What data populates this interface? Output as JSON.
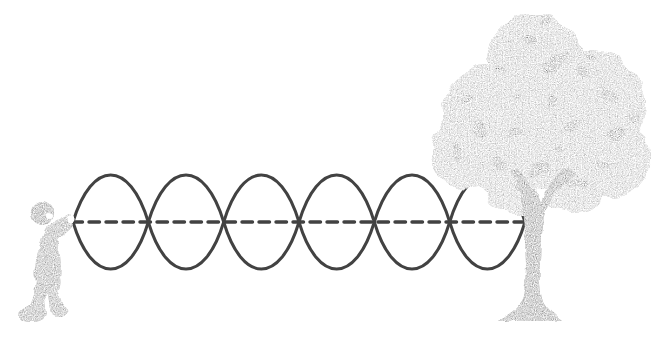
{
  "scene": {
    "description": "A child holds one end of a rope attached to a tree trunk; the rope oscillates as a standing wave with six loops about a dashed horizontal equilibrium line.",
    "background": "#ffffff"
  },
  "palette": {
    "wave_stroke": "#424242",
    "dash_stroke": "#424242",
    "foliage": "#a5a5a5",
    "foliage_spots": "#4f4f4f",
    "trunk": "#6f6f6f",
    "child_body": "#828282",
    "child_head": "#6c6c6c",
    "highlight": "#ffffff"
  },
  "wave": {
    "type": "standing-wave",
    "loops": 6,
    "x_start": 73,
    "x_end": 525,
    "center_y": 222,
    "amplitude": 47,
    "stroke_width": 3,
    "dashed_line": {
      "x_start": 72,
      "x_end": 541,
      "y": 222,
      "stroke_width": 3.4,
      "dash_array": "10.5 6.5"
    }
  }
}
